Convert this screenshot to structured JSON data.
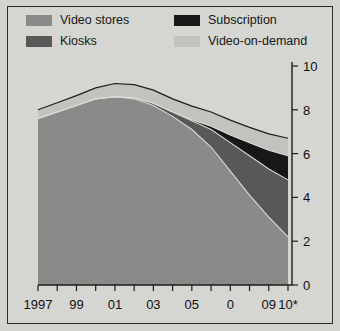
{
  "chart_data": {
    "type": "area",
    "stacked": true,
    "title": "",
    "subtitle": "",
    "xlabel": "",
    "ylabel": "",
    "grid": false,
    "legend_position": "top",
    "x": [
      1997,
      1998,
      1999,
      2000,
      2001,
      2002,
      2003,
      2004,
      2005,
      2006,
      2007,
      2008,
      2009,
      2010
    ],
    "xtick_labels": [
      "1997",
      "",
      "99",
      "",
      "01",
      "",
      "03",
      "",
      "05",
      "",
      "0",
      "",
      "09",
      "10*"
    ],
    "xlim": [
      1997,
      2010
    ],
    "ylim": [
      0,
      10
    ],
    "ytick_labels": [
      "0",
      "2",
      "4",
      "6",
      "8",
      "10"
    ],
    "ytick_values": [
      0,
      2,
      4,
      6,
      8,
      10
    ],
    "series": [
      {
        "name": "Video stores",
        "color": "#8a8a88",
        "values": [
          7.6,
          7.9,
          8.2,
          8.5,
          8.6,
          8.5,
          8.2,
          7.7,
          7.1,
          6.3,
          5.2,
          4.1,
          3.1,
          2.2
        ]
      },
      {
        "name": "Kiosks",
        "color": "#585856",
        "values": [
          0.0,
          0.0,
          0.0,
          0.0,
          0.0,
          0.05,
          0.1,
          0.2,
          0.4,
          0.8,
          1.3,
          1.8,
          2.2,
          2.6
        ]
      },
      {
        "name": "Subscription",
        "color": "#171717",
        "values": [
          0.0,
          0.0,
          0.0,
          0.0,
          0.0,
          0.0,
          0.0,
          0.0,
          0.05,
          0.15,
          0.35,
          0.6,
          0.85,
          1.1
        ]
      },
      {
        "name": "Video-on-demand",
        "color": "#c2c2bf",
        "values": [
          0.4,
          0.42,
          0.45,
          0.5,
          0.6,
          0.6,
          0.6,
          0.6,
          0.62,
          0.65,
          0.68,
          0.7,
          0.75,
          0.8
        ]
      }
    ],
    "totals": [
      8.0,
      8.32,
      8.65,
      9.0,
      9.2,
      9.15,
      8.9,
      8.5,
      8.17,
      7.9,
      7.53,
      7.2,
      6.9,
      6.7
    ]
  },
  "legend": {
    "items": [
      {
        "label": "Video stores",
        "color": "#8a8a88"
      },
      {
        "label": "Kiosks",
        "color": "#585856"
      },
      {
        "label": "Subscription",
        "color": "#171717"
      },
      {
        "label": "Video-on-demand",
        "color": "#c2c2bf"
      }
    ]
  },
  "axes": {
    "y_labels": [
      "10",
      "8",
      "6",
      "4",
      "2",
      "0"
    ],
    "x_labels": [
      "1997",
      "99",
      "01",
      "03",
      "05",
      "0",
      "09",
      "10*"
    ]
  }
}
